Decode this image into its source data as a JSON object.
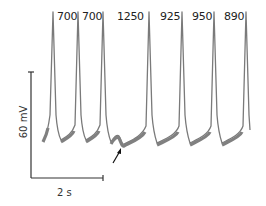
{
  "figure": {
    "interval_labels": [
      {
        "text": "700",
        "x": 57
      },
      {
        "text": "700",
        "x": 82
      },
      {
        "text": "1250",
        "x": 117
      },
      {
        "text": "925",
        "x": 160
      },
      {
        "text": "950",
        "x": 192
      },
      {
        "text": "890",
        "x": 224
      }
    ],
    "scale_bar": {
      "vertical_label": "60 mV",
      "horizontal_label": "2 s"
    },
    "trace_color": "#7a7a7a",
    "annotation": "arrow pointing to delayed afterdepolarization in long interval"
  }
}
